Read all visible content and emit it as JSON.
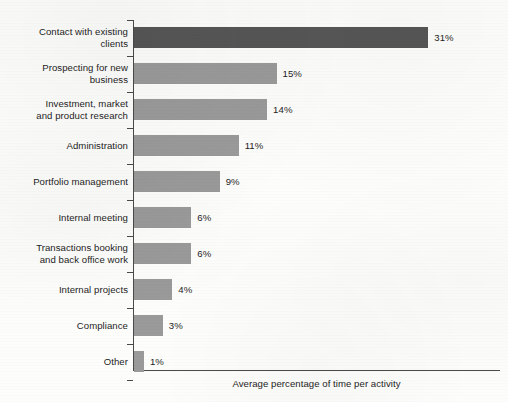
{
  "chart_data": {
    "type": "bar",
    "orientation": "horizontal",
    "title": "",
    "subtitle": "",
    "xlabel": "Average percentage of time per activity",
    "ylabel": "",
    "xlim": [
      0,
      31
    ],
    "grid": false,
    "legend": null,
    "value_suffix": "%",
    "categories": [
      "Contact with existing\nclients",
      "Prospecting for new\nbusiness",
      "Investment, market\nand product research",
      "Administration",
      "Portfolio management",
      "Internal meeting",
      "Transactions booking\nand back office work",
      "Internal projects",
      "Compliance",
      "Other"
    ],
    "values": [
      31,
      15,
      14,
      11,
      9,
      6,
      6,
      4,
      3,
      1
    ],
    "value_labels": [
      "31%",
      "15%",
      "14%",
      "11%",
      "9%",
      "6%",
      "6%",
      "4%",
      "3%",
      "1%"
    ],
    "bar_colors": [
      "#565656",
      "#9a9a9a",
      "#9a9a9a",
      "#9a9a9a",
      "#9a9a9a",
      "#9a9a9a",
      "#9a9a9a",
      "#9a9a9a",
      "#9a9a9a",
      "#9a9a9a"
    ],
    "axis_color": "#4a4a4a",
    "text_color": "#1d1d1d",
    "background_color": "#fdfdfc"
  }
}
